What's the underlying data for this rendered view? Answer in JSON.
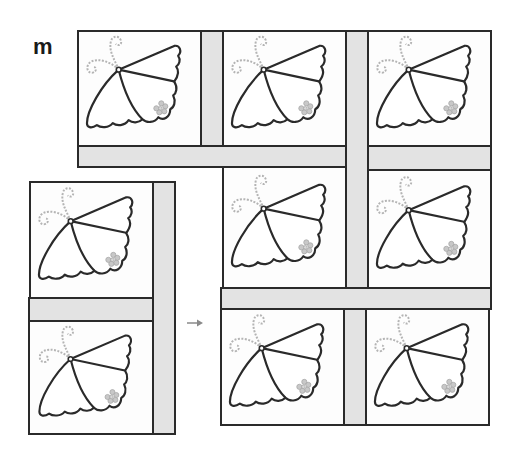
{
  "figure": {
    "label": "m",
    "colors": {
      "outline": "#2a2a2a",
      "sashing": "#e3e3e3",
      "block_background": "#fdfdfd",
      "embroidery": "#b4b4b4",
      "arrow": "#8a8a8a"
    },
    "icons": {
      "block_motif": "butterfly-icon",
      "block_accent": "flower-icon",
      "step_indicator": "arrow-right-icon"
    },
    "assembled_section": {
      "rows": [
        {
          "blocks": 3,
          "motif": "butterfly"
        },
        {
          "blocks": 2,
          "motif": "butterfly"
        },
        {
          "blocks": 2,
          "motif": "butterfly"
        }
      ]
    },
    "new_section": {
      "columns": 1,
      "blocks": 2,
      "motif": "butterfly",
      "sashing": [
        "horizontal-between-blocks",
        "vertical-right-side"
      ]
    }
  }
}
